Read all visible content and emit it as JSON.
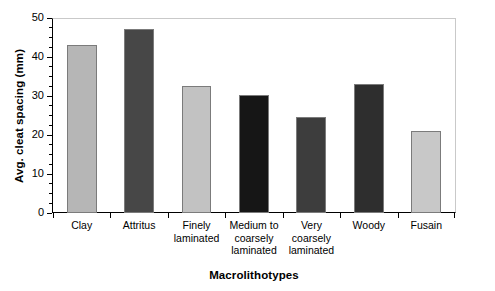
{
  "chart_data": {
    "type": "bar",
    "title": "",
    "subtitle": "",
    "xlabel": "Macrolithotypes",
    "ylabel": "Avg. cleat spacing (mm)",
    "categories": [
      "Clay",
      "Attritus",
      "Finely laminated",
      "Medium to coarsely laminated",
      "Very coarsely laminated",
      "Woody",
      "Fusain"
    ],
    "category_lines": [
      [
        "Clay"
      ],
      [
        "Attritus"
      ],
      [
        "Finely",
        "laminated"
      ],
      [
        "Medium to",
        "coarsely",
        "laminated"
      ],
      [
        "Very",
        "coarsely",
        "laminated"
      ],
      [
        "Woody"
      ],
      [
        "Fusain"
      ]
    ],
    "values": [
      43.0,
      47.2,
      32.5,
      30.3,
      24.5,
      33.0,
      21.0
    ],
    "bar_colors": [
      "#b6b6b6",
      "#474747",
      "#c2c2c2",
      "#161616",
      "#3d3d3d",
      "#2e2e2e",
      "#c8c8c8"
    ],
    "bar_border_color": "#7b7b7b",
    "ylim": [
      0,
      50
    ],
    "ytick_major": [
      0,
      10,
      20,
      30,
      40,
      50
    ],
    "ytick_major_labels": [
      "0",
      "10",
      "20",
      "30",
      "40",
      "50"
    ],
    "ytick_minor_step": 2.5,
    "grid": false,
    "legend": null,
    "legend_position": "none",
    "axis_color": "#000000",
    "frame_top_right_color": "#c9c9c9",
    "background": "#ffffff"
  }
}
